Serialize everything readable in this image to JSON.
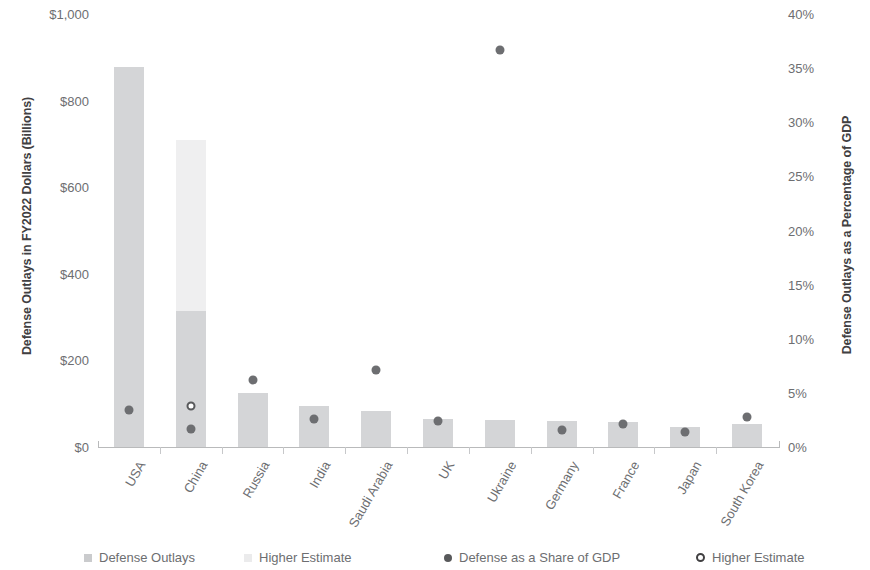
{
  "chart_data": {
    "type": "bar",
    "title": "",
    "xlabel": "",
    "ylabel": "Defense Outlays in FY2022 Dollars (Billions)",
    "y2label": "Defense Outlays as a Percentage of GDP",
    "categories": [
      "USA",
      "China",
      "Russia",
      "India",
      "Saudi Arabia",
      "UK",
      "Ukraine",
      "Germany",
      "France",
      "Japan",
      "South Korea"
    ],
    "ylim": [
      0,
      1000
    ],
    "y2lim": [
      0,
      40
    ],
    "yticks": [
      "$0",
      "$200",
      "$400",
      "$600",
      "$800",
      "$1,000"
    ],
    "ytick_values": [
      0,
      200,
      400,
      600,
      800,
      1000
    ],
    "y2ticks": [
      "0%",
      "5%",
      "10%",
      "15%",
      "20%",
      "25%",
      "30%",
      "35%",
      "40%"
    ],
    "y2tick_values": [
      0,
      5,
      10,
      15,
      20,
      25,
      30,
      35,
      40
    ],
    "grid": false,
    "legend_position": "bottom",
    "series": [
      {
        "name": "Defense Outlays",
        "type": "bar",
        "axis": "left",
        "color": "#d4d5d7",
        "values": [
          877,
          315,
          125,
          95,
          83,
          65,
          62,
          60,
          58,
          46,
          53
        ]
      },
      {
        "name": "Higher Estimate",
        "type": "bar",
        "axis": "left",
        "color": "#efeff0",
        "values": [
          null,
          710,
          null,
          null,
          null,
          null,
          null,
          null,
          null,
          null,
          null
        ]
      },
      {
        "name": "Defense as a Share of GDP",
        "type": "scatter",
        "axis": "right",
        "color": "#6d6e71",
        "values": [
          3.4,
          1.7,
          6.2,
          2.6,
          7.1,
          2.4,
          36.7,
          1.6,
          2.1,
          1.4,
          2.8
        ]
      },
      {
        "name": "Higher Estimate",
        "type": "scatter",
        "axis": "right",
        "color": "#ffffff",
        "values": [
          null,
          3.8,
          null,
          null,
          null,
          null,
          null,
          null,
          null,
          null,
          null
        ]
      }
    ]
  },
  "legend": {
    "items": [
      {
        "label": "Defense Outlays",
        "marker": "square",
        "color": "#cacbcd"
      },
      {
        "label": "Higher Estimate",
        "marker": "square",
        "color": "#ebebec"
      },
      {
        "label": "Defense as a Share of GDP",
        "marker": "dot",
        "color": "#58595b"
      },
      {
        "label": "Higher Estimate",
        "marker": "dot-hollow",
        "color": "#414042"
      }
    ]
  },
  "colors": {
    "bar_base": "#d4d5d7",
    "bar_high": "#efeff0",
    "dot": "#6d6e71",
    "axis": "#b9babb",
    "text": "#6d6e71",
    "title_text": "#414042"
  }
}
